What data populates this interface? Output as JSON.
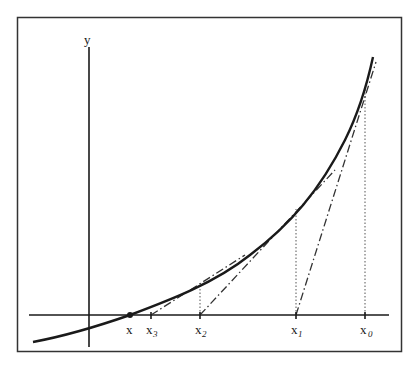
{
  "diagram": {
    "axis_labels": {
      "y": "y"
    },
    "points": [
      {
        "id": "root",
        "label": "x",
        "subscript": "",
        "px": 130
      },
      {
        "id": "x3",
        "label": "x",
        "subscript": "3",
        "px": 151
      },
      {
        "id": "x2",
        "label": "x",
        "subscript": "2",
        "px": 200
      },
      {
        "id": "x1",
        "label": "x",
        "subscript": "1",
        "px": 296
      },
      {
        "id": "x0",
        "label": "x",
        "subscript": "0",
        "px": 365
      }
    ],
    "colors": {
      "curve": "#1a1a1a",
      "axes": "#1a1a1a",
      "frame": "#333333",
      "guides": "#555555"
    }
  }
}
